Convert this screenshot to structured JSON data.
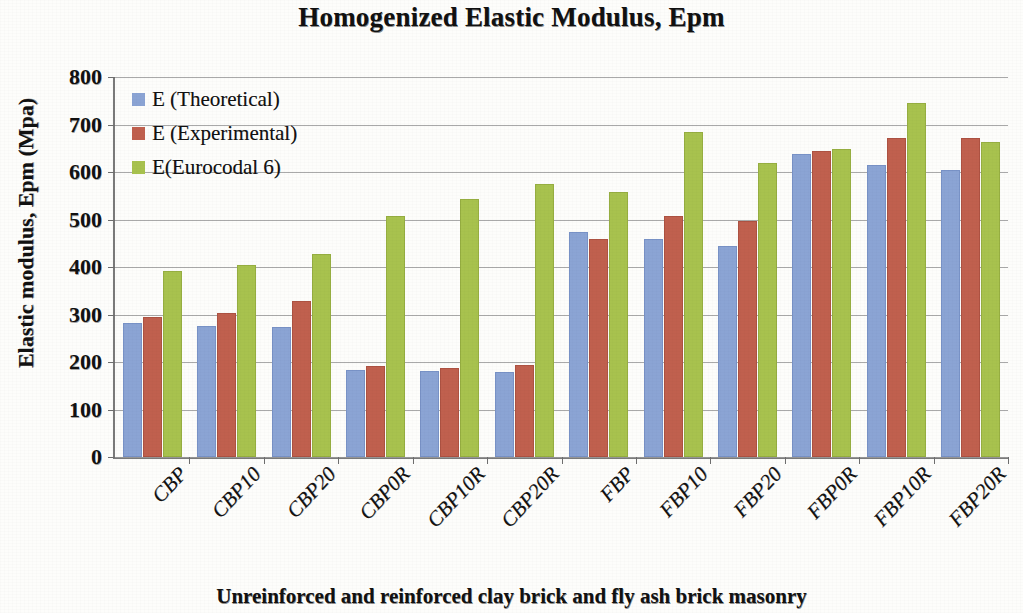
{
  "chart_data": {
    "type": "bar",
    "title": "Homogenized Elastic Modulus, Epm",
    "xlabel": "Unreinforced and reinforced clay brick and fly ash brick masonry",
    "ylabel": "Elastic modulus, Epm (Mpa)",
    "ylim": [
      0,
      800
    ],
    "ytick_step": 100,
    "yticks": [
      "800",
      "700",
      "600",
      "500",
      "400",
      "300",
      "200",
      "100",
      "0"
    ],
    "grid": true,
    "legend_position": "upper-left-inside",
    "categories": [
      "CBP",
      "CBP10",
      "CBP20",
      "CBP0R",
      "CBP10R",
      "CBP20R",
      "FBP",
      "FBP10",
      "FBP20",
      "FBP0R",
      "FBP10R",
      "FBP20R"
    ],
    "series": [
      {
        "name": "E (Theoretical)",
        "color": "#8ba4d4",
        "values": [
          278,
          272,
          270,
          178,
          176,
          175,
          470,
          455,
          440,
          634,
          610,
          600
        ]
      },
      {
        "name": "E (Experimental)",
        "color": "#c0604e",
        "values": [
          290,
          298,
          324,
          188,
          183,
          190,
          455,
          503,
          492,
          641,
          668,
          667
        ]
      },
      {
        "name": "E(Eurocodal 6)",
        "color": "#a8c24e",
        "values": [
          387,
          400,
          424,
          504,
          538,
          570,
          554,
          681,
          615,
          645,
          742,
          660
        ]
      }
    ]
  }
}
